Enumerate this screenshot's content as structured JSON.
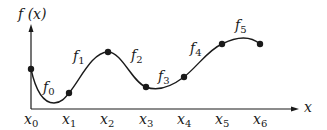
{
  "diagram": {
    "y_axis_label": "f (x)",
    "x_axis_label": "x",
    "nodes": [
      {
        "label": "x",
        "sub": "0",
        "px": 31,
        "py": 69
      },
      {
        "label": "x",
        "sub": "1",
        "px": 69,
        "py": 93
      },
      {
        "label": "x",
        "sub": "2",
        "px": 108,
        "py": 52
      },
      {
        "label": "x",
        "sub": "3",
        "px": 146,
        "py": 87
      },
      {
        "label": "x",
        "sub": "4",
        "px": 184,
        "py": 77
      },
      {
        "label": "x",
        "sub": "5",
        "px": 222,
        "py": 44
      },
      {
        "label": "x",
        "sub": "6",
        "px": 260,
        "py": 44
      }
    ],
    "segments": [
      {
        "label": "f",
        "sub": "0"
      },
      {
        "label": "f",
        "sub": "1"
      },
      {
        "label": "f",
        "sub": "2"
      },
      {
        "label": "f",
        "sub": "3"
      },
      {
        "label": "f",
        "sub": "4"
      },
      {
        "label": "f",
        "sub": "5"
      }
    ],
    "colors": {
      "ink": "#1a1a1a",
      "background": "#ffffff"
    }
  }
}
